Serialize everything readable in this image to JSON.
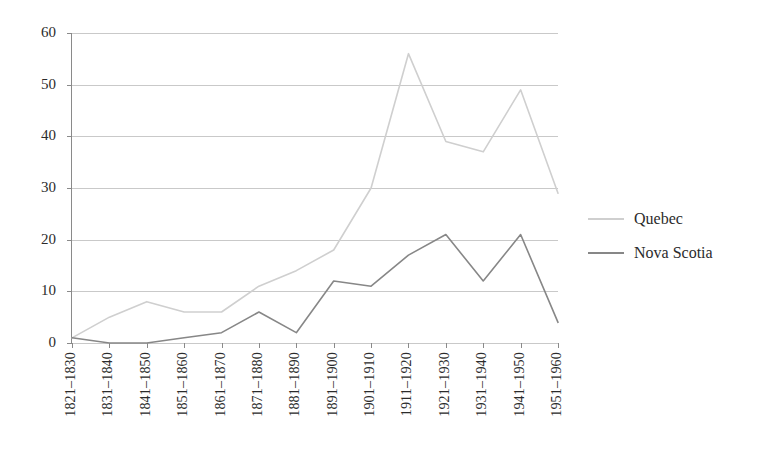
{
  "chart_data": {
    "type": "line",
    "title": "",
    "subtitle": "",
    "xlabel": "",
    "ylabel": "",
    "ylim": [
      0,
      60
    ],
    "ytick_step": 10,
    "yticks": [
      0,
      10,
      20,
      30,
      40,
      50,
      60
    ],
    "grid": true,
    "legend_position": "right",
    "categories": [
      "1821–1830",
      "1831–1840",
      "1841–1850",
      "1851–1860",
      "1861–1870",
      "1871–1880",
      "1881–1890",
      "1891–1900",
      "1901–1910",
      "1911–1920",
      "1921–1930",
      "1931–1940",
      "1941–1950",
      "1951–1960"
    ],
    "series": [
      {
        "name": "Quebec",
        "color": "#cfcfcf",
        "values": [
          1,
          5,
          8,
          6,
          6,
          11,
          14,
          18,
          30,
          56,
          39,
          37,
          49,
          29
        ]
      },
      {
        "name": "Nova Scotia",
        "color": "#878787",
        "values": [
          1,
          0,
          0,
          1,
          2,
          6,
          2,
          12,
          11,
          17,
          21,
          12,
          21,
          4
        ]
      }
    ]
  },
  "axis": {
    "y_tick_labels": [
      "0",
      "10",
      "20",
      "30",
      "40",
      "50",
      "60"
    ]
  },
  "legend": {
    "items": [
      {
        "label": "Quebec",
        "color": "#cfcfcf"
      },
      {
        "label": "Nova Scotia",
        "color": "#878787"
      }
    ]
  }
}
